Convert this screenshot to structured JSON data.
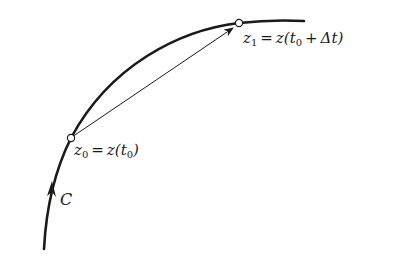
{
  "diagram": {
    "curve_label": "C",
    "point_z0": {
      "var": "z",
      "sub": "0",
      "eq": "=",
      "rhs_func": "z(",
      "rhs_arg_var": "t",
      "rhs_arg_sub": "0",
      "rhs_close": ")"
    },
    "point_z1": {
      "var": "z",
      "sub": "1",
      "eq": "=",
      "rhs_func": "z(",
      "rhs_arg_var": "t",
      "rhs_arg_sub": "0",
      "rhs_plus": "+",
      "rhs_delta": "Δt",
      "rhs_close": ")"
    },
    "colors": {
      "stroke": "#1a1a1a",
      "background": "#ffffff"
    }
  }
}
